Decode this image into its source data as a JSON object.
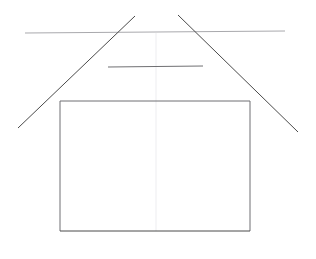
{
  "canvas": {
    "width": 316,
    "height": 259,
    "background": "#ffffff"
  },
  "caption": {
    "text": "图 — 几何作图（顶部文字被裁切）",
    "color": "#b9b9bd",
    "visible": "clipped"
  },
  "palette": {
    "dark_stroke": "#4a4a4a",
    "mid_stroke": "#6f6f72",
    "light_stroke": "#9a9a9e",
    "faint_stroke": "#e2e2e6",
    "background": "#ffffff"
  },
  "figure": {
    "shapes": [
      {
        "name": "horizontal-guide-line",
        "type": "line",
        "x1": 25,
        "y1": 33,
        "x2": 285,
        "y2": 31,
        "color": "#a9a9ad",
        "width": 1
      },
      {
        "name": "left-diagonal-line",
        "type": "line",
        "x1": 135,
        "y1": 16,
        "x2": 18,
        "y2": 128,
        "color": "#4a4a4a",
        "width": 1
      },
      {
        "name": "right-diagonal-line",
        "type": "line",
        "x1": 178,
        "y1": 15,
        "x2": 298,
        "y2": 132,
        "color": "#4a4a4a",
        "width": 1
      },
      {
        "name": "upper-crossbar-line",
        "type": "line",
        "x1": 108,
        "y1": 67,
        "x2": 203,
        "y2": 66,
        "color": "#6f6f72",
        "width": 1
      },
      {
        "name": "rectangle-top-edge",
        "type": "line",
        "x1": 60,
        "y1": 101,
        "x2": 250,
        "y2": 101,
        "color": "#6f6f72",
        "width": 1
      },
      {
        "name": "rectangle-left-edge",
        "type": "line",
        "x1": 60,
        "y1": 101,
        "x2": 60,
        "y2": 231,
        "color": "#6f6f72",
        "width": 1
      },
      {
        "name": "rectangle-right-edge",
        "type": "line",
        "x1": 250,
        "y1": 101,
        "x2": 250,
        "y2": 231,
        "color": "#6f6f72",
        "width": 1
      },
      {
        "name": "rectangle-bottom-edge",
        "type": "line",
        "x1": 60,
        "y1": 231,
        "x2": 250,
        "y2": 231,
        "color": "#4a4a4a",
        "width": 1
      },
      {
        "name": "center-axis-line",
        "type": "line",
        "x1": 156,
        "y1": 33,
        "x2": 156,
        "y2": 231,
        "color": "#ededf0",
        "width": 1
      }
    ],
    "vertices": {
      "apex_crossing": {
        "x": 156,
        "y": 32
      },
      "rect_top_left": {
        "x": 60,
        "y": 101
      },
      "rect_top_right": {
        "x": 250,
        "y": 101
      },
      "rect_bottom_left": {
        "x": 60,
        "y": 231
      },
      "rect_bottom_right": {
        "x": 250,
        "y": 231
      },
      "crossbar_left": {
        "x": 108,
        "y": 67
      },
      "crossbar_right": {
        "x": 203,
        "y": 66
      },
      "guide_left_end": {
        "x": 25,
        "y": 33
      },
      "guide_right_end": {
        "x": 285,
        "y": 31
      },
      "left_diagonal_tail": {
        "x": 18,
        "y": 128
      },
      "right_diagonal_tail": {
        "x": 298,
        "y": 132
      }
    }
  }
}
